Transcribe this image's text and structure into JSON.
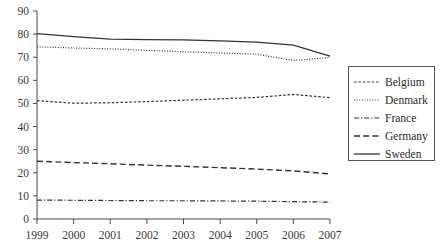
{
  "chart_data": {
    "type": "line",
    "title": "",
    "subtitle": "",
    "xlabel": "",
    "ylabel": "",
    "x": [
      1999,
      2000,
      2001,
      2002,
      2003,
      2004,
      2005,
      2006,
      2007
    ],
    "xtick_labels": [
      "1999",
      "2000",
      "2001",
      "2002",
      "2003",
      "2004",
      "2005",
      "2006",
      "2007"
    ],
    "ytick_labels": [
      "0",
      "10",
      "20",
      "30",
      "40",
      "50",
      "60",
      "70",
      "80",
      "90"
    ],
    "ytick_values": [
      0,
      10,
      20,
      30,
      40,
      50,
      60,
      70,
      80,
      90
    ],
    "xlim": [
      1999,
      2007
    ],
    "ylim": [
      0,
      90
    ],
    "grid": false,
    "legend_position": "right",
    "series": [
      {
        "name": "Belgium",
        "line_style": "dashed",
        "color": "#333333",
        "values": [
          51.2,
          50.1,
          50.3,
          50.8,
          51.4,
          52.0,
          52.6,
          53.9,
          52.5
        ]
      },
      {
        "name": "Denmark",
        "line_style": "dotted",
        "color": "#333333",
        "values": [
          74.5,
          74.0,
          73.6,
          73.0,
          72.4,
          71.8,
          71.3,
          68.6,
          69.9
        ]
      },
      {
        "name": "France",
        "line_style": "dash-dot",
        "color": "#333333",
        "values": [
          8.2,
          8.1,
          8.0,
          7.9,
          7.9,
          7.8,
          7.7,
          7.5,
          7.3
        ]
      },
      {
        "name": "Germany",
        "line_style": "long-dash",
        "color": "#333333",
        "values": [
          25.0,
          24.4,
          23.9,
          23.3,
          22.8,
          22.2,
          21.6,
          20.8,
          19.5
        ]
      },
      {
        "name": "Sweden",
        "line_style": "solid",
        "color": "#333333",
        "values": [
          80.2,
          78.9,
          77.8,
          77.6,
          77.5,
          77.1,
          76.5,
          75.2,
          70.5
        ]
      }
    ]
  },
  "legend": {
    "entries": [
      {
        "label": "Belgium"
      },
      {
        "label": "Denmark"
      },
      {
        "label": "France"
      },
      {
        "label": "Germany"
      },
      {
        "label": "Sweden"
      }
    ]
  }
}
